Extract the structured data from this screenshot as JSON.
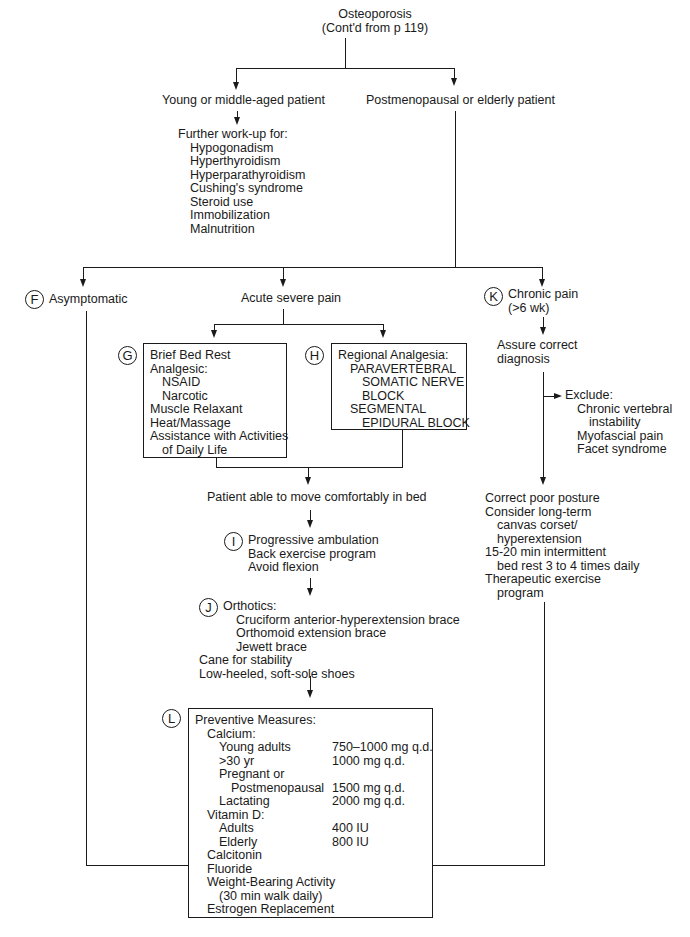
{
  "title": {
    "line1": "Osteoporosis",
    "line2": "(Cont'd from p 119)"
  },
  "branch_young": {
    "label": "Young or middle-aged patient",
    "workup_title": "Further work-up for:",
    "workup_items": [
      "Hypogonadism",
      "Hyperthyroidism",
      "Hyperparathyroidism",
      "Cushing's syndrome",
      "Steroid use",
      "Immobilization",
      "Malnutrition"
    ]
  },
  "branch_post": {
    "label": "Postmenopausal or elderly patient"
  },
  "node_f": {
    "marker": "F",
    "label": "Asymptomatic"
  },
  "node_acute": {
    "label": "Acute severe pain"
  },
  "node_k": {
    "marker": "K",
    "label_line1": "Chronic pain",
    "label_line2": "(>6 wk)"
  },
  "node_g": {
    "marker": "G",
    "items": [
      "Brief Bed Rest",
      "Analgesic:",
      "NSAID",
      "Narcotic",
      "Muscle Relaxant",
      "Heat/Massage",
      "Assistance with Activities",
      "of Daily Life"
    ]
  },
  "node_h": {
    "marker": "H",
    "items": [
      "Regional Analgesia:",
      "PARAVERTEBRAL",
      "SOMATIC NERVE",
      "BLOCK",
      "SEGMENTAL",
      "EPIDURAL BLOCK"
    ]
  },
  "assure": {
    "line1": "Assure correct",
    "line2": "diagnosis"
  },
  "exclude": {
    "title": "Exclude:",
    "items": [
      "Chronic vertebral",
      "instability",
      "Myofascial pain",
      "Facet syndrome"
    ]
  },
  "move_bed": {
    "label": "Patient able to move comfortably in bed"
  },
  "node_i": {
    "marker": "I",
    "items": [
      "Progressive ambulation",
      "Back exercise program",
      "Avoid flexion"
    ]
  },
  "chronic_tx": {
    "items": [
      "Correct poor posture",
      "Consider long-term",
      "canvas corset/",
      "hyperextension",
      "15-20 min intermittent",
      "bed rest 3 to 4 times daily",
      "Therapeutic exercise",
      "program"
    ]
  },
  "node_j": {
    "marker": "J",
    "title": "Orthotics:",
    "braces": [
      "Cruciform anterior-hyperextension brace",
      "Orthomoid extension brace",
      "Jewett brace"
    ],
    "other": [
      "Cane for stability",
      "Low-heeled, soft-sole shoes"
    ]
  },
  "node_l": {
    "marker": "L",
    "title": "Preventive Measures:",
    "calcium_title": "Calcium:",
    "calcium": [
      {
        "group": "Young adults",
        "dose": "750–1000 mg q.d."
      },
      {
        "group": ">30 yr",
        "dose": "1000 mg q.d."
      },
      {
        "group": "Pregnant or",
        "dose": ""
      },
      {
        "group": "Postmenopausal",
        "dose": "1500 mg q.d."
      },
      {
        "group": "Lactating",
        "dose": "2000 mg q.d."
      }
    ],
    "vitd_title": "Vitamin D:",
    "vitd": [
      {
        "group": "Adults",
        "dose": "400 IU"
      },
      {
        "group": "Elderly",
        "dose": "800 IU"
      }
    ],
    "others": [
      "Calcitonin",
      "Fluoride",
      "Weight-Bearing Activity",
      "(30 min walk daily)",
      "Estrogen Replacement"
    ]
  }
}
